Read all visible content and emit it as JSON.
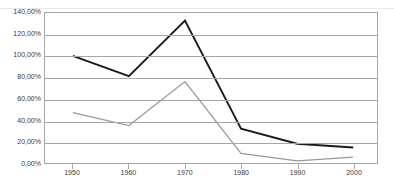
{
  "chart_data": {
    "type": "line",
    "title": "",
    "xlabel": "",
    "ylabel": "",
    "categories": [
      "1950",
      "1960",
      "1970",
      "1980",
      "1990",
      "2000"
    ],
    "x": [
      1950,
      1960,
      1970,
      1980,
      1990,
      2000
    ],
    "series": [
      {
        "name": "series-black",
        "color": "#1a1a1a",
        "values": [
          100.0,
          81.0,
          133.0,
          32.0,
          18.0,
          14.5
        ]
      },
      {
        "name": "series-grey",
        "color": "#999999",
        "values": [
          47.0,
          35.0,
          76.0,
          9.0,
          2.0,
          5.5
        ]
      }
    ],
    "ylim": [
      0,
      140
    ],
    "ytick_values": [
      0,
      20,
      40,
      60,
      80,
      100,
      120,
      140
    ],
    "ytick_labels": [
      "0,00%",
      "20,00%",
      "40,00%",
      "60,00%",
      "80,00%",
      "100,00%",
      "120,00%",
      "140,00%"
    ],
    "xtick_labels": [
      "1950",
      "1960",
      "1970",
      "1980",
      "1990",
      "2000"
    ],
    "grid": true,
    "grid_axis": "y",
    "legend": false,
    "legend_position": "none",
    "annotations": [],
    "decimal_separator": ",",
    "units": "percent"
  },
  "axes": {
    "y_labels": [
      "140,00%",
      "120,00%",
      "100,00%",
      "80,00%",
      "60,00%",
      "40,00%",
      "20,00%",
      "0,00%"
    ],
    "x_labels": [
      "1950",
      "1960",
      "1970",
      "1980",
      "1990",
      "2000"
    ]
  },
  "colors": {
    "series_black": "#1a1a1a",
    "series_grey": "#999999",
    "grid": "#a6a6a6",
    "frame": "#a6a6a6",
    "text": "#3a3a3a",
    "background": "#ffffff"
  },
  "title_ghost": ""
}
